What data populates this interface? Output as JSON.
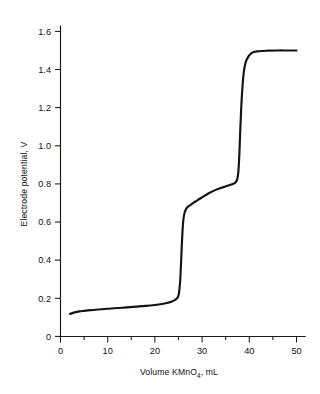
{
  "chart_data": {
    "type": "line",
    "title": "",
    "xlabel": "Volume KMnO4, mL",
    "xlabel_main": "Volume KMnO",
    "xlabel_sub": "4",
    "xlabel_tail": ", mL",
    "ylabel": "Electrode potential, V",
    "xlim": [
      0,
      52
    ],
    "ylim": [
      0,
      1.68
    ],
    "grid": false,
    "legend": "none",
    "x_ticks": [
      0,
      10,
      20,
      30,
      40,
      50
    ],
    "x_tick_labels": [
      "0",
      "10",
      "20",
      "30",
      "40",
      "50"
    ],
    "x_minor_ticks": [
      5,
      15,
      25,
      35,
      45
    ],
    "y_ticks": [
      0,
      0.2,
      0.4,
      0.6,
      0.8,
      1.0,
      1.2,
      1.4,
      1.6
    ],
    "y_tick_labels": [
      "0",
      "0.2",
      "0.4",
      "0.6",
      "0.8",
      "1.0",
      "1.2",
      "1.4",
      "1.6"
    ],
    "series": [
      {
        "name": "Electrode potential",
        "color": "#141414",
        "x": [
          2.0,
          3.0,
          4.0,
          5.0,
          6.5,
          8.0,
          10.0,
          12.0,
          14.0,
          16.0,
          18.0,
          20.0,
          21.5,
          22.5,
          23.5,
          24.2,
          24.7,
          25.0,
          25.2,
          25.4,
          25.6,
          25.8,
          26.0,
          26.3,
          26.7,
          27.2,
          28.0,
          29.0,
          30.0,
          31.5,
          33.0,
          34.5,
          36.0,
          36.8,
          37.2,
          37.5,
          37.7,
          37.9,
          38.1,
          38.4,
          38.8,
          39.4,
          40.5,
          42.0,
          44.0,
          46.0,
          48.0,
          50.0
        ],
        "y": [
          0.118,
          0.126,
          0.131,
          0.134,
          0.138,
          0.141,
          0.145,
          0.149,
          0.152,
          0.156,
          0.16,
          0.165,
          0.17,
          0.175,
          0.182,
          0.19,
          0.2,
          0.215,
          0.245,
          0.31,
          0.42,
          0.53,
          0.605,
          0.65,
          0.672,
          0.684,
          0.698,
          0.714,
          0.73,
          0.752,
          0.77,
          0.783,
          0.795,
          0.803,
          0.812,
          0.83,
          0.87,
          0.96,
          1.09,
          1.25,
          1.38,
          1.45,
          1.487,
          1.496,
          1.499,
          1.5,
          1.5,
          1.5
        ]
      }
    ],
    "annotations": [],
    "equivalence_points": [
      {
        "volume": 25.5,
        "potential": 0.44
      },
      {
        "volume": 37.9,
        "potential": 1.0
      }
    ]
  }
}
